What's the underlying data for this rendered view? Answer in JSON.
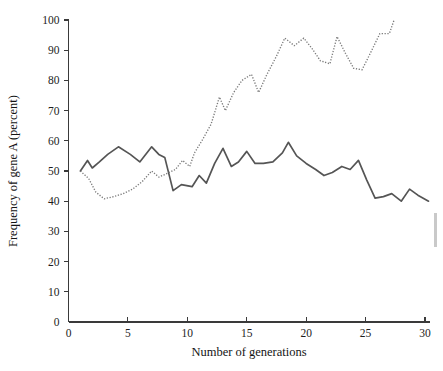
{
  "figure": {
    "background_color": "#ffffff",
    "axis_color": "#3a3a3a",
    "text_color": "#1d1d1d"
  },
  "chart_data": {
    "type": "line",
    "title": "",
    "subtitle": "",
    "xlabel": "Number of generations",
    "ylabel": "Frequency of gene A (percent)",
    "xlim": [
      0,
      30.7
    ],
    "ylim": [
      0,
      100
    ],
    "xticks": [
      0,
      5,
      10,
      15,
      20,
      25,
      30
    ],
    "xtick_labels": [
      "0",
      "5",
      "10",
      "15",
      "20",
      "25",
      "30"
    ],
    "yticks": [
      0,
      10,
      20,
      30,
      40,
      50,
      60,
      70,
      80,
      90,
      100
    ],
    "ytick_labels": [
      "0",
      "10",
      "20",
      "30",
      "40",
      "50",
      "60",
      "70",
      "80",
      "90",
      "100"
    ],
    "grid": false,
    "legend": null,
    "legend_position": "none",
    "series": [
      {
        "name": "population-1-solid",
        "style": "solid",
        "color": "#555555",
        "x": [
          1.0,
          1.6,
          2.0,
          2.6,
          3.3,
          4.2,
          5.2,
          6.0,
          7.0,
          7.6,
          8.1,
          8.8,
          9.5,
          10.4,
          11.0,
          11.6,
          12.3,
          13.0,
          13.7,
          14.3,
          15.0,
          15.7,
          16.4,
          17.2,
          18.0,
          18.5,
          19.2,
          20.0,
          20.8,
          21.5,
          22.2,
          23.0,
          23.7,
          24.4,
          25.1,
          25.8,
          26.5,
          27.2,
          28.0,
          28.7,
          29.4,
          30.3
        ],
        "y": [
          50.0,
          53.5,
          51.0,
          53.0,
          55.5,
          58.0,
          55.5,
          53.0,
          58.0,
          55.5,
          54.5,
          43.5,
          45.5,
          44.8,
          48.5,
          46.0,
          52.5,
          57.5,
          51.5,
          53.0,
          56.5,
          52.5,
          52.5,
          53.0,
          56.0,
          59.5,
          55.0,
          52.5,
          50.5,
          48.5,
          49.5,
          51.5,
          50.5,
          53.5,
          47.0,
          41.0,
          41.5,
          42.5,
          40.0,
          44.0,
          42.0,
          40.0
        ]
      },
      {
        "name": "population-2-dotted",
        "style": "dotted",
        "color": "#7a7a7a",
        "x": [
          1.0,
          1.7,
          2.3,
          3.0,
          3.8,
          4.6,
          5.4,
          6.2,
          7.0,
          7.6,
          8.2,
          9.0,
          9.6,
          10.2,
          10.6,
          11.3,
          12.0,
          12.7,
          13.2,
          13.9,
          14.6,
          15.4,
          16.0,
          16.7,
          17.5,
          18.2,
          19.0,
          19.8,
          20.5,
          21.2,
          22.0,
          22.6,
          23.3,
          24.0,
          24.7,
          25.4,
          26.2,
          27.0,
          27.4
        ],
        "y": [
          50.0,
          47.5,
          43.0,
          40.8,
          41.5,
          42.5,
          44.0,
          46.5,
          50.0,
          48.0,
          49.0,
          50.5,
          53.5,
          51.5,
          56.0,
          60.5,
          65.5,
          74.5,
          70.0,
          76.0,
          80.0,
          82.0,
          76.0,
          82.0,
          88.0,
          94.0,
          91.5,
          94.0,
          90.5,
          86.5,
          85.5,
          94.5,
          89.0,
          84.0,
          83.5,
          89.0,
          95.5,
          95.5,
          100.0
        ]
      }
    ],
    "annotations": []
  }
}
